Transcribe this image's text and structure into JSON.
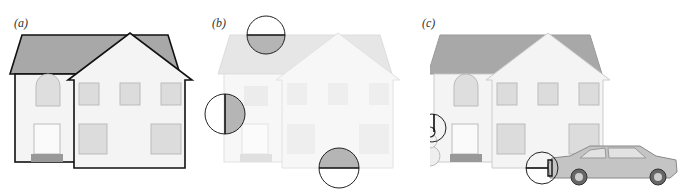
{
  "figure": {
    "panels": [
      {
        "label": "(a)",
        "description": "house with occluding contours outlined"
      },
      {
        "label": "(b)",
        "description": "faded house with three circular aperture views of contour edges"
      },
      {
        "label": "(c)",
        "description": "house with snowman and car, apertures showing occlusion junctions"
      }
    ]
  },
  "colors": {
    "roof": "#a8a8a8",
    "roof_faded": "#dcdcdc",
    "wall": "#f4f4f4",
    "outline": "#111111",
    "window": "#d0d0d0",
    "aperture_fill": "#b5b5b5",
    "car": "#c4c4c4"
  }
}
